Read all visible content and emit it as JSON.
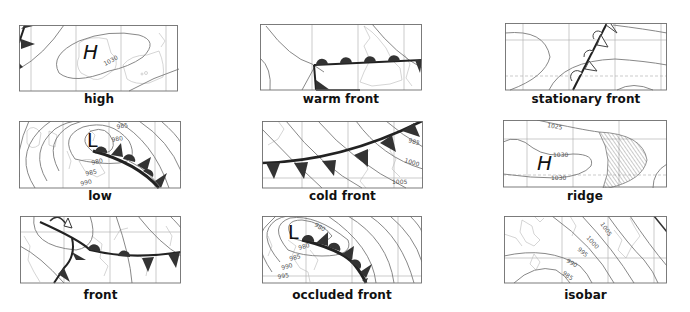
{
  "panels": [
    {
      "id": "high",
      "caption": "high",
      "center_label": "H",
      "isobar_labels": [
        "1030"
      ]
    },
    {
      "id": "warm-front",
      "caption": "warm front"
    },
    {
      "id": "stationary-front",
      "caption": "stationary front"
    },
    {
      "id": "low",
      "caption": "low",
      "center_label": "L",
      "isobar_labels": [
        "985",
        "980",
        "980",
        "985",
        "990"
      ]
    },
    {
      "id": "cold-front",
      "caption": "cold front",
      "isobar_labels": [
        "985",
        "1000",
        "1005"
      ]
    },
    {
      "id": "ridge",
      "caption": "ridge",
      "center_label": "H",
      "isobar_labels": [
        "1025",
        "1030",
        "1030"
      ]
    },
    {
      "id": "front",
      "caption": "front"
    },
    {
      "id": "occluded-front",
      "caption": "occluded front",
      "center_label": "L",
      "isobar_labels": [
        "980",
        "980",
        "985",
        "990",
        "995"
      ]
    },
    {
      "id": "isobar",
      "caption": "isobar",
      "isobar_labels": [
        "1005",
        "1000",
        "995",
        "990",
        "985"
      ]
    }
  ],
  "colors": {
    "front": "#222222",
    "isobar": "#7a7a7a",
    "coast": "#b9b9b9",
    "grid": "#a9a9a9",
    "symbol_fill": "#333333"
  }
}
